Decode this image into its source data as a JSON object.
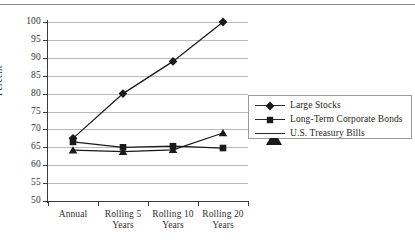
{
  "chart_data": {
    "type": "line",
    "title": "",
    "xlabel": "",
    "ylabel": "Percent",
    "ylim": [
      50,
      100
    ],
    "yticks": [
      50,
      55,
      60,
      65,
      70,
      75,
      80,
      85,
      90,
      95,
      100
    ],
    "ytick_labels": [
      "50",
      "55",
      "60",
      "65",
      "70",
      "75",
      "80",
      "85",
      "90",
      "95",
      "100"
    ],
    "grid": true,
    "legend_position": "right",
    "categories": [
      "Annual",
      "Rolling 5 Years",
      "Rolling 10 Years",
      "Rolling 20 Years"
    ],
    "category_lines": [
      [
        "Annual",
        ""
      ],
      [
        "Rolling 5",
        "Years"
      ],
      [
        "Rolling 10",
        "Years"
      ],
      [
        "Rolling 20",
        "Years"
      ]
    ],
    "series": [
      {
        "name": "Large Stocks",
        "marker": "diamond",
        "color": "#1a1a1a",
        "values": [
          67.5,
          80.0,
          89.0,
          100.0
        ]
      },
      {
        "name": "Long-Term Corporate Bonds",
        "marker": "square",
        "color": "#1a1a1a",
        "values": [
          66.5,
          65.0,
          65.3,
          64.8
        ]
      },
      {
        "name": "U.S. Treasury Bills",
        "marker": "triangle",
        "color": "#1a1a1a",
        "values": [
          64.2,
          63.8,
          64.3,
          69.0
        ]
      }
    ]
  },
  "legend": {
    "items": [
      {
        "label": "Large Stocks",
        "marker": "diamond"
      },
      {
        "label": "Long-Term Corporate Bonds",
        "marker": "square"
      },
      {
        "label": "U.S. Treasury Bills",
        "marker": "triangle"
      }
    ]
  },
  "axes": {
    "y_title": "Percent"
  },
  "colors": {
    "ink": "#231f20",
    "gridline": "#b9b9b9",
    "axis": "#3a3a3a",
    "legend_border": "#9b9b9b",
    "rule": "#8a8a8a"
  }
}
